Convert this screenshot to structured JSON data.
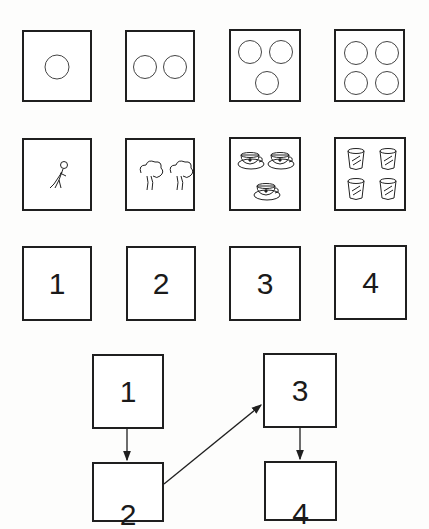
{
  "rows": {
    "circles": {
      "counts": [
        1,
        2,
        3,
        4
      ],
      "icon": "circle-icon"
    },
    "pictures": {
      "items": [
        {
          "count": 1,
          "icon": "stick-figure-icon"
        },
        {
          "count": 2,
          "icon": "tree-icon"
        },
        {
          "count": 3,
          "icon": "teacup-icon"
        },
        {
          "count": 4,
          "icon": "glass-icon"
        }
      ]
    },
    "numerals": [
      "1",
      "2",
      "3",
      "4"
    ]
  },
  "flow": {
    "nodes": [
      "1",
      "2",
      "3",
      "4"
    ],
    "edges": [
      [
        "1",
        "2"
      ],
      [
        "2",
        "3"
      ],
      [
        "3",
        "4"
      ]
    ]
  }
}
